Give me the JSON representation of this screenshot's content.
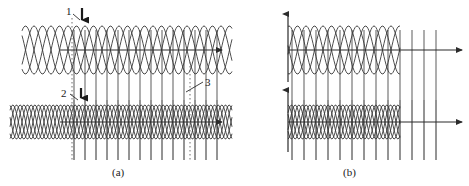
{
  "figure": {
    "width": 469,
    "height": 186,
    "background_color": "#ffffff",
    "curve_color": "#3a3a3a",
    "bar_color": "#8a8a8a",
    "axis_color": "#2b2b2b",
    "dotted_color": "#6e6e6e",
    "leader_color": "#2b2b2b"
  },
  "panels": [
    {
      "id": "a",
      "caption": "(a)",
      "x0": 0,
      "x1": 232,
      "traces": [
        {
          "id": "a-upper",
          "name": "upper-waveform-row",
          "axis_y": 50,
          "axis_x_start": 60,
          "axis_x_end": 222,
          "wave_amplitude": 24,
          "wave_period": 34,
          "wave_x_start": 22,
          "wave_x_end": 232,
          "wave_count": 2,
          "bars_x_start": 74,
          "bars_x_end": 224,
          "bars_spacing": 11,
          "bars_y_top": 30,
          "bars_y_bottom": 160
        },
        {
          "id": "a-lower",
          "name": "lower-waveform-row",
          "axis_y": 122,
          "axis_x_start": 60,
          "axis_x_end": 222,
          "wave_amplitude": 17,
          "wave_period": 22,
          "wave_x_start": 10,
          "wave_x_end": 232,
          "wave_count": 3,
          "bars_x_start": 74,
          "bars_x_end": 224,
          "bars_spacing": 11,
          "bars_y_top": 100,
          "bars_y_bottom": 160
        }
      ],
      "dotted_lines": [
        {
          "name": "dotted-guide-left",
          "x": 72,
          "y_top": 18,
          "y_bottom": 160
        },
        {
          "name": "dotted-guide-right",
          "x": 190,
          "y_top": 62,
          "y_bottom": 160
        }
      ]
    },
    {
      "id": "b",
      "caption": "(b)",
      "x0": 232,
      "x1": 469,
      "traces": [
        {
          "id": "b-upper",
          "name": "upper-waveform-row",
          "axis_y": 50,
          "axis_x_start": 288,
          "axis_x_end": 462,
          "wave_amplitude": 24,
          "wave_period": 34,
          "wave_x_start": 288,
          "wave_x_end": 400,
          "wave_count": 2,
          "bars_x_start": 292,
          "bars_x_end": 436,
          "bars_spacing": 12,
          "bars_y_top": 30,
          "bars_y_bottom": 160
        },
        {
          "id": "b-lower",
          "name": "lower-waveform-row",
          "axis_y": 122,
          "axis_x_start": 288,
          "axis_x_end": 462,
          "wave_amplitude": 17,
          "wave_period": 22,
          "wave_x_start": 288,
          "wave_x_end": 400,
          "wave_count": 3,
          "bars_x_start": 292,
          "bars_x_end": 436,
          "bars_spacing": 12,
          "bars_y_top": 100,
          "bars_y_bottom": 160
        }
      ],
      "vertical_axes": [
        {
          "name": "vertical-axis-upper",
          "x": 288,
          "y_top": 14,
          "y_bottom": 82
        },
        {
          "name": "vertical-axis-lower",
          "x": 288,
          "y_top": 90,
          "y_bottom": 152
        }
      ]
    }
  ],
  "callouts": [
    {
      "id": "1",
      "label": "1",
      "name": "callout-1",
      "label_x": 66,
      "label_y": 5,
      "leader": {
        "x1": 73,
        "y1": 14,
        "x2": 80,
        "y2": 20
      },
      "arrow": {
        "x": 82,
        "y_start": 8,
        "y_end": 26,
        "direction": "down"
      }
    },
    {
      "id": "2",
      "label": "2",
      "name": "callout-2",
      "label_x": 61,
      "label_y": 87,
      "leader": {
        "x1": 70,
        "y1": 94,
        "x2": 78,
        "y2": 100
      },
      "arrow": {
        "x": 81,
        "y_start": 88,
        "y_end": 104,
        "direction": "down"
      }
    },
    {
      "id": "3",
      "label": "3",
      "name": "callout-3",
      "label_x": 205,
      "label_y": 76,
      "leader": {
        "x1": 203,
        "y1": 82,
        "x2": 186,
        "y2": 92
      }
    }
  ]
}
